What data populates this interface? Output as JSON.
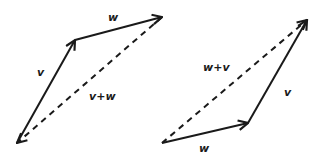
{
  "diagram": {
    "type": "vector-addition-parallelogram",
    "stroke_color": "#1a1a1a",
    "background": "#ffffff",
    "left": {
      "title": "v then w",
      "points": {
        "origin": [
          17,
          143
        ],
        "v_tip": [
          75,
          40
        ],
        "w_tip": [
          162,
          17
        ]
      },
      "vectors": [
        {
          "name": "v",
          "from": "origin",
          "to": "v_tip",
          "style": "solid"
        },
        {
          "name": "w",
          "from": "v_tip",
          "to": "w_tip",
          "style": "solid"
        },
        {
          "name": "v+w",
          "from": "origin",
          "to": "w_tip",
          "style": "dashed"
        }
      ],
      "labels": {
        "v": {
          "text": "v",
          "x": 37,
          "y": 76
        },
        "w": {
          "text": "w",
          "x": 108,
          "y": 21
        },
        "sum": {
          "text": "v+w",
          "x": 89,
          "y": 100
        }
      }
    },
    "right": {
      "title": "w then v",
      "points": {
        "origin": [
          162,
          143
        ],
        "w_tip": [
          248,
          123
        ],
        "v_tip": [
          307,
          20
        ]
      },
      "vectors": [
        {
          "name": "w",
          "from": "origin",
          "to": "w_tip",
          "style": "solid"
        },
        {
          "name": "v",
          "from": "w_tip",
          "to": "v_tip",
          "style": "solid"
        },
        {
          "name": "w+v",
          "from": "origin",
          "to": "v_tip",
          "style": "dashed"
        }
      ],
      "labels": {
        "w": {
          "text": "w",
          "x": 199,
          "y": 152
        },
        "v": {
          "text": "v",
          "x": 284,
          "y": 96
        },
        "sum": {
          "text": "w+v",
          "x": 203,
          "y": 71
        }
      }
    }
  }
}
